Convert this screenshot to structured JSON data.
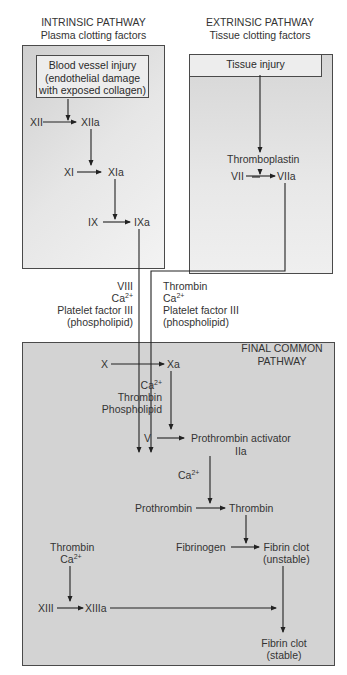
{
  "intrinsic": {
    "title": "INTRINSIC PATHWAY",
    "subtitle": "Plasma clotting factors",
    "trigger_lines": [
      "Blood vessel injury",
      "(endothelial damage",
      "with exposed collagen)"
    ],
    "steps": [
      {
        "from": "XII",
        "to": "XIIa"
      },
      {
        "from": "XI",
        "to": "XIa"
      },
      {
        "from": "IX",
        "to": "IXa"
      }
    ],
    "cofactors": [
      "VIII",
      "Ca",
      "Platelet factor III",
      "(phospholipid)"
    ]
  },
  "extrinsic": {
    "title": "EXTRINSIC PATHWAY",
    "subtitle": "Tissue clotting factors",
    "trigger": "Tissue injury",
    "intermediate": "Thromboplastin",
    "steps": [
      {
        "from": "VII",
        "to": "VIIa"
      }
    ],
    "cofactors": [
      "Thrombin",
      "Ca",
      "Platelet factor III",
      "(phospholipid)"
    ]
  },
  "common": {
    "title_lines": [
      "FINAL COMMON",
      "PATHWAY"
    ],
    "x_step": {
      "from": "X",
      "to": "Xa"
    },
    "xa_cofactors": [
      "Ca",
      "Thrombin",
      "Phospholipid"
    ],
    "v_step": {
      "from": "V",
      "to": "Prothrombin activator",
      "to_sub": "IIa"
    },
    "ca_label": "Ca",
    "prothrombin_step": {
      "from": "Prothrombin",
      "to": "Thrombin"
    },
    "fibrin_step": {
      "from": "Fibrinogen",
      "to": "Fibrin clot",
      "to_sub": "(unstable)"
    },
    "xiii_cofactors": [
      "Thrombin",
      "Ca"
    ],
    "xiii_step": {
      "from": "XIII",
      "to": "XIIIa"
    },
    "final": [
      "Fibrin clot",
      "(stable)"
    ],
    "superscript": "2+"
  }
}
